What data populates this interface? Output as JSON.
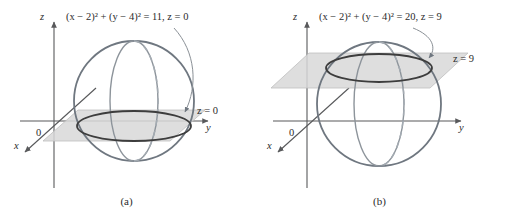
{
  "figure": {
    "background": "#ffffff",
    "panels": [
      {
        "id": "a",
        "caption": "(a)",
        "equation": "(x − 2)² + (y − 4)² = 11, z = 0",
        "equation_parts": {
          "lhs": "(x − 2)² + (y − 4)²",
          "radius_squared": "11",
          "plane_condition": "z = 0"
        },
        "plane_label": "z = 0",
        "plane_height": 0,
        "circle_radius_squared": 11,
        "axes": {
          "z_label": "z",
          "y_label": "y",
          "x_label": "x",
          "origin_label": "0"
        }
      },
      {
        "id": "b",
        "caption": "(b)",
        "equation": "(x − 2)² + (y − 4)² = 20, z = 9",
        "equation_parts": {
          "lhs": "(x − 2)² + (y − 4)²",
          "radius_squared": "20",
          "plane_condition": "z = 9"
        },
        "plane_label": "z = 9",
        "plane_height": 9,
        "circle_radius_squared": 20,
        "axes": {
          "z_label": "z",
          "y_label": "y",
          "x_label": "x",
          "origin_label": "0"
        }
      }
    ],
    "colors": {
      "sphere_outline": "#6f7780",
      "meridian": "#7d858d",
      "meridian_dashed": "#9aa1a8",
      "plane_fill": "#d8d8d8",
      "plane_stroke": "#b4b4b4",
      "intersection_circle": "#3d3d3d",
      "axis": "#58595b",
      "leader_line": "#8a9096",
      "text": "#2b2b2b"
    }
  }
}
